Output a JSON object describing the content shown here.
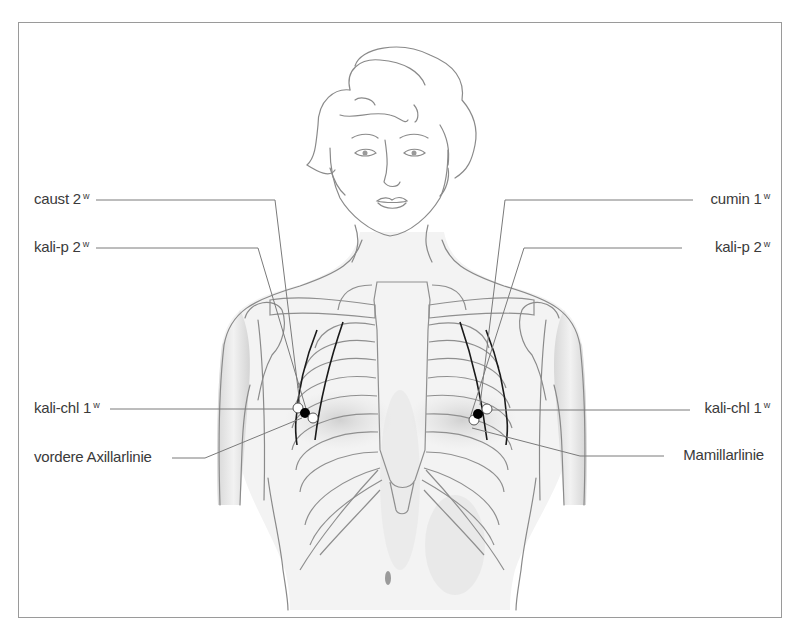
{
  "figure": {
    "colors": {
      "frame": "#9a9a9a",
      "outline": "#8a8a8a",
      "leader_line": "#7a7a7a",
      "meridian_line": "#1a1a1a",
      "point_filled": "#000000",
      "point_open": "#ffffff",
      "text": "#3a3a3a"
    }
  },
  "labels": {
    "left": [
      {
        "id": "caust",
        "text": "caust 2",
        "sup": "w"
      },
      {
        "id": "kali-p-left",
        "text": "kali-p 2",
        "sup": "w"
      },
      {
        "id": "kali-chl-left",
        "text": "kali-chl 1",
        "sup": "w"
      },
      {
        "id": "vordere-axillarlinie",
        "text": "vordere Axillarlinie",
        "sup": ""
      }
    ],
    "right": [
      {
        "id": "cumin",
        "text": "cumin 1",
        "sup": "w"
      },
      {
        "id": "kali-p-right",
        "text": "kali-p 2",
        "sup": "w"
      },
      {
        "id": "kali-chl-right",
        "text": "kali-chl 1",
        "sup": "w"
      },
      {
        "id": "mamillarlinie",
        "text": "Mamillarlinie",
        "sup": ""
      }
    ]
  }
}
